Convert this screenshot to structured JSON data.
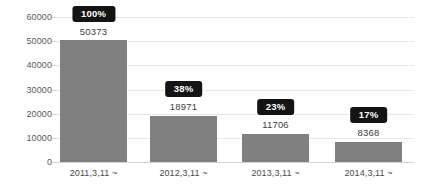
{
  "chart_data": {
    "type": "bar",
    "title": "",
    "xlabel": "",
    "ylabel": "",
    "categories": [
      "2011,3,11 ~",
      "2012,3,11 ~",
      "2013,3,11 ~",
      "2014,3,11 ~"
    ],
    "values": [
      50373,
      18971,
      11706,
      8368
    ],
    "value_labels": [
      "50373",
      "18971",
      "11706",
      "8368"
    ],
    "percent_labels": [
      "100%",
      "38%",
      "23%",
      "17%"
    ],
    "percent_values": [
      100,
      38,
      23,
      17
    ],
    "ylim": [
      0,
      60000
    ],
    "y_ticks": [
      0,
      10000,
      20000,
      30000,
      40000,
      50000,
      60000
    ],
    "y_tick_labels": [
      "0",
      "10000",
      "20000",
      "30000",
      "40000",
      "50000",
      "60000"
    ],
    "grid": true,
    "legend": "none",
    "colors": {
      "bar": "#808080",
      "badge_background": "#141414",
      "badge_text": "#ffffff",
      "gridline": "#e8e8e8",
      "axis": "#d4d4d4",
      "tick_text": "#595959",
      "value_text": "#3c3c3c",
      "background": "#ffffff"
    }
  }
}
